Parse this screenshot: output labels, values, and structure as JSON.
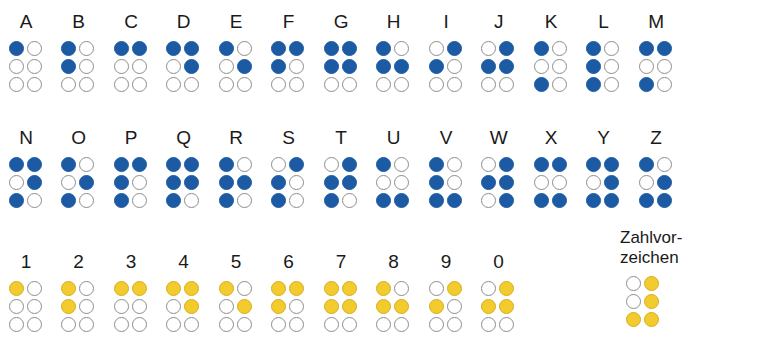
{
  "colors": {
    "letter_dot": "#1c5ba4",
    "number_dot": "#f2cb2e",
    "empty_dot_border": "#8d8d8d",
    "background": "#ffffff",
    "text": "#1a1a1a"
  },
  "legend": {
    "dot_positions": "2 columns x 3 rows; dots numbered 1-2-3 left column top-to-bottom, 4-5-6 right column top-to-bottom",
    "filled_means": "raised dot",
    "empty_means": "no dot"
  },
  "rows": [
    {
      "name": "letters-row-1",
      "dot_color": "#1c5ba4",
      "cells": [
        {
          "label": "A",
          "dots": [
            1
          ]
        },
        {
          "label": "B",
          "dots": [
            1,
            2
          ]
        },
        {
          "label": "C",
          "dots": [
            1,
            4
          ]
        },
        {
          "label": "D",
          "dots": [
            1,
            4,
            5
          ]
        },
        {
          "label": "E",
          "dots": [
            1,
            5
          ]
        },
        {
          "label": "F",
          "dots": [
            1,
            2,
            4
          ]
        },
        {
          "label": "G",
          "dots": [
            1,
            2,
            4,
            5
          ]
        },
        {
          "label": "H",
          "dots": [
            1,
            2,
            5
          ]
        },
        {
          "label": "I",
          "dots": [
            2,
            4
          ]
        },
        {
          "label": "J",
          "dots": [
            2,
            4,
            5
          ]
        },
        {
          "label": "K",
          "dots": [
            1,
            3
          ]
        },
        {
          "label": "L",
          "dots": [
            1,
            2,
            3
          ]
        },
        {
          "label": "M",
          "dots": [
            1,
            3,
            4
          ]
        }
      ]
    },
    {
      "name": "letters-row-2",
      "dot_color": "#1c5ba4",
      "cells": [
        {
          "label": "N",
          "dots": [
            1,
            3,
            4,
            5
          ]
        },
        {
          "label": "O",
          "dots": [
            1,
            3,
            5
          ]
        },
        {
          "label": "P",
          "dots": [
            1,
            2,
            3,
            4
          ]
        },
        {
          "label": "Q",
          "dots": [
            1,
            2,
            3,
            4,
            5
          ]
        },
        {
          "label": "R",
          "dots": [
            1,
            2,
            3,
            5
          ]
        },
        {
          "label": "S",
          "dots": [
            2,
            3,
            4
          ]
        },
        {
          "label": "T",
          "dots": [
            2,
            3,
            4,
            5
          ]
        },
        {
          "label": "U",
          "dots": [
            1,
            3,
            6
          ]
        },
        {
          "label": "V",
          "dots": [
            1,
            2,
            3,
            6
          ]
        },
        {
          "label": "W",
          "dots": [
            2,
            4,
            5,
            6
          ]
        },
        {
          "label": "X",
          "dots": [
            1,
            3,
            4,
            6
          ]
        },
        {
          "label": "Y",
          "dots": [
            1,
            3,
            4,
            5,
            6
          ]
        },
        {
          "label": "Z",
          "dots": [
            1,
            3,
            5,
            6
          ]
        }
      ]
    },
    {
      "name": "numbers-row",
      "dot_color": "#f2cb2e",
      "cells": [
        {
          "label": "1",
          "dots": [
            1
          ]
        },
        {
          "label": "2",
          "dots": [
            1,
            2
          ]
        },
        {
          "label": "3",
          "dots": [
            1,
            4
          ]
        },
        {
          "label": "4",
          "dots": [
            1,
            4,
            5
          ]
        },
        {
          "label": "5",
          "dots": [
            1,
            5
          ]
        },
        {
          "label": "6",
          "dots": [
            1,
            2,
            4
          ]
        },
        {
          "label": "7",
          "dots": [
            1,
            2,
            4,
            5
          ]
        },
        {
          "label": "8",
          "dots": [
            1,
            2,
            5
          ]
        },
        {
          "label": "9",
          "dots": [
            2,
            4
          ]
        },
        {
          "label": "0",
          "dots": [
            2,
            4,
            5
          ]
        }
      ]
    }
  ],
  "special": {
    "label_line1": "Zahlvor-",
    "label_line2": "zeichen",
    "dot_color": "#f2cb2e",
    "dots": [
      3,
      4,
      5,
      6
    ]
  }
}
